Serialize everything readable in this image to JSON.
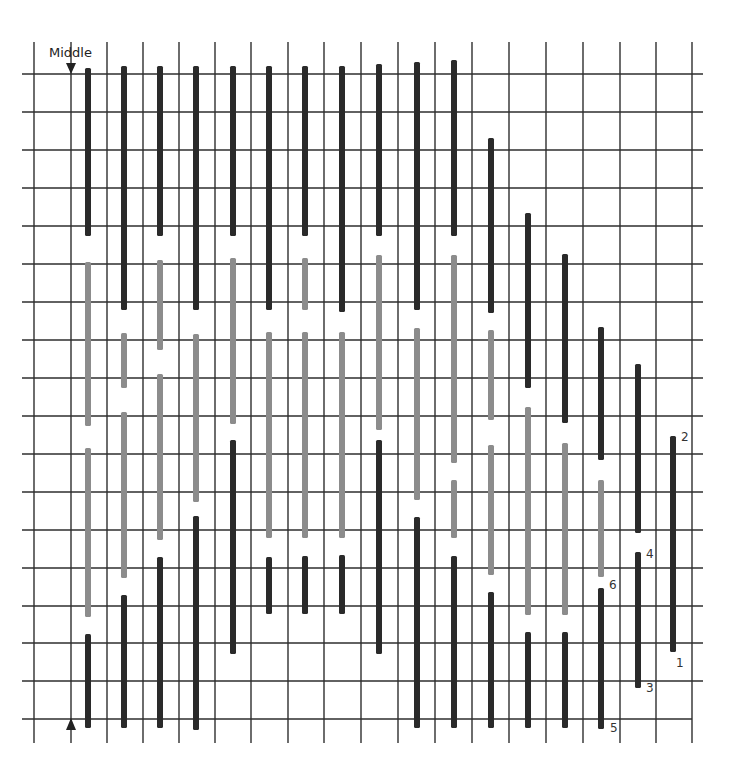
{
  "diagram": {
    "type": "bargello-stitch-chart",
    "middle_label": "Middle",
    "colors": {
      "background": "#ffffff",
      "grid": "#2e2e2e",
      "dark_stitch": "#2a2a2a",
      "light_stitch": "#8c8c8c"
    },
    "grid": {
      "vertical_lines_x": [
        34,
        71,
        107,
        143,
        179,
        215,
        251,
        288,
        324,
        361,
        398,
        435,
        472,
        509,
        546,
        583,
        620,
        656,
        692
      ],
      "vertical_top": 42,
      "vertical_bottom": 743,
      "horizontal_lines_y": [
        74,
        112,
        150,
        188,
        226,
        264,
        302,
        340,
        378,
        416,
        454,
        492,
        530,
        568,
        606,
        643,
        681,
        719
      ],
      "horizontal_left": 22,
      "horizontal_right": 703
    },
    "stitch_width": 6,
    "columns": [
      {
        "x": 88,
        "segments": [
          {
            "tone": "dark",
            "y1": 68,
            "y2": 236
          },
          {
            "tone": "light",
            "y1": 262,
            "y2": 426
          },
          {
            "tone": "light",
            "y1": 448,
            "y2": 617
          },
          {
            "tone": "dark",
            "y1": 634,
            "y2": 728
          }
        ]
      },
      {
        "x": 124,
        "segments": [
          {
            "tone": "dark",
            "y1": 66,
            "y2": 310
          },
          {
            "tone": "light",
            "y1": 333,
            "y2": 388
          },
          {
            "tone": "light",
            "y1": 412,
            "y2": 578
          },
          {
            "tone": "dark",
            "y1": 595,
            "y2": 728
          }
        ]
      },
      {
        "x": 160,
        "segments": [
          {
            "tone": "dark",
            "y1": 66,
            "y2": 236
          },
          {
            "tone": "light",
            "y1": 260,
            "y2": 350
          },
          {
            "tone": "light",
            "y1": 374,
            "y2": 540
          },
          {
            "tone": "dark",
            "y1": 557,
            "y2": 728
          }
        ]
      },
      {
        "x": 196,
        "segments": [
          {
            "tone": "dark",
            "y1": 66,
            "y2": 310
          },
          {
            "tone": "light",
            "y1": 334,
            "y2": 502
          },
          {
            "tone": "dark",
            "y1": 516,
            "y2": 730
          }
        ]
      },
      {
        "x": 233,
        "segments": [
          {
            "tone": "dark",
            "y1": 66,
            "y2": 236
          },
          {
            "tone": "light",
            "y1": 258,
            "y2": 424
          },
          {
            "tone": "dark",
            "y1": 440,
            "y2": 654
          }
        ]
      },
      {
        "x": 269,
        "segments": [
          {
            "tone": "dark",
            "y1": 66,
            "y2": 310
          },
          {
            "tone": "light",
            "y1": 332,
            "y2": 538
          },
          {
            "tone": "dark",
            "y1": 557,
            "y2": 614
          }
        ]
      },
      {
        "x": 305,
        "segments": [
          {
            "tone": "dark",
            "y1": 66,
            "y2": 236
          },
          {
            "tone": "light",
            "y1": 258,
            "y2": 310
          },
          {
            "tone": "light",
            "y1": 332,
            "y2": 538
          },
          {
            "tone": "dark",
            "y1": 556,
            "y2": 614
          }
        ]
      },
      {
        "x": 342,
        "segments": [
          {
            "tone": "dark",
            "y1": 66,
            "y2": 312
          },
          {
            "tone": "light",
            "y1": 332,
            "y2": 538
          },
          {
            "tone": "dark",
            "y1": 555,
            "y2": 614
          }
        ]
      },
      {
        "x": 379,
        "segments": [
          {
            "tone": "dark",
            "y1": 64,
            "y2": 236
          },
          {
            "tone": "light",
            "y1": 255,
            "y2": 430
          },
          {
            "tone": "dark",
            "y1": 440,
            "y2": 654
          }
        ]
      },
      {
        "x": 417,
        "segments": [
          {
            "tone": "dark",
            "y1": 62,
            "y2": 310
          },
          {
            "tone": "light",
            "y1": 328,
            "y2": 500
          },
          {
            "tone": "dark",
            "y1": 517,
            "y2": 728
          }
        ]
      },
      {
        "x": 454,
        "segments": [
          {
            "tone": "dark",
            "y1": 60,
            "y2": 236
          },
          {
            "tone": "light",
            "y1": 255,
            "y2": 463
          },
          {
            "tone": "light",
            "y1": 480,
            "y2": 538
          },
          {
            "tone": "dark",
            "y1": 556,
            "y2": 728
          }
        ]
      },
      {
        "x": 491,
        "segments": [
          {
            "tone": "dark",
            "y1": 138,
            "y2": 313
          },
          {
            "tone": "light",
            "y1": 330,
            "y2": 420
          },
          {
            "tone": "light",
            "y1": 445,
            "y2": 575
          },
          {
            "tone": "dark",
            "y1": 592,
            "y2": 728
          }
        ]
      },
      {
        "x": 528,
        "segments": [
          {
            "tone": "dark",
            "y1": 213,
            "y2": 388
          },
          {
            "tone": "light",
            "y1": 407,
            "y2": 615
          },
          {
            "tone": "dark",
            "y1": 632,
            "y2": 728
          }
        ]
      },
      {
        "x": 565,
        "segments": [
          {
            "tone": "dark",
            "y1": 254,
            "y2": 423
          },
          {
            "tone": "light",
            "y1": 443,
            "y2": 615
          },
          {
            "tone": "dark",
            "y1": 632,
            "y2": 728
          }
        ]
      },
      {
        "x": 601,
        "segments": [
          {
            "tone": "dark",
            "y1": 327,
            "y2": 460
          },
          {
            "tone": "light",
            "y1": 480,
            "y2": 577
          },
          {
            "tone": "dark",
            "y1": 588,
            "y2": 729
          }
        ]
      },
      {
        "x": 638,
        "segments": [
          {
            "tone": "dark",
            "y1": 364,
            "y2": 533
          },
          {
            "tone": "dark",
            "y1": 552,
            "y2": 688
          }
        ]
      },
      {
        "x": 673,
        "segments": [
          {
            "tone": "dark",
            "y1": 436,
            "y2": 652
          }
        ]
      }
    ],
    "markers": {
      "top_arrow": {
        "x": 71,
        "y": 74,
        "direction": "down"
      },
      "bottom_arrow": {
        "x": 71,
        "y": 718,
        "direction": "up"
      }
    },
    "stitch_order_labels": [
      {
        "text": "1",
        "x": 676,
        "y": 667
      },
      {
        "text": "2",
        "x": 681,
        "y": 441
      },
      {
        "text": "3",
        "x": 646,
        "y": 692
      },
      {
        "text": "4",
        "x": 646,
        "y": 558
      },
      {
        "text": "5",
        "x": 610,
        "y": 732
      },
      {
        "text": "6",
        "x": 609,
        "y": 589
      }
    ]
  }
}
